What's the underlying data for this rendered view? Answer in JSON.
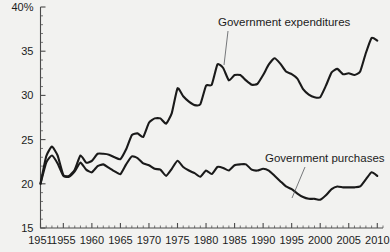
{
  "chart_data": {
    "type": "line",
    "title": "",
    "subtitle": "",
    "xlabel": "",
    "ylabel": "",
    "ylim": [
      15,
      40
    ],
    "xlim": [
      1951,
      2011
    ],
    "grid": false,
    "legend_position": "inline-annotations",
    "y_ticks": [
      "15",
      "20",
      "25",
      "30",
      "35",
      "40%"
    ],
    "y_tick_values": [
      15,
      20,
      25,
      30,
      35,
      40
    ],
    "y_minor_step": 1,
    "x_ticks": [
      "1951",
      "1955",
      "1960",
      "1965",
      "1970",
      "1975",
      "1980",
      "1985",
      "1990",
      "1995",
      "2000",
      "2005",
      "2010"
    ],
    "x_tick_values": [
      1951,
      1955,
      1960,
      1965,
      1970,
      1975,
      1980,
      1985,
      1990,
      1995,
      2000,
      2005,
      2010
    ],
    "x_minor_step": 1,
    "annotations": [
      {
        "name": "expenditures-annotation",
        "text": "Government expenditures",
        "text_x": 218,
        "text_y": 26,
        "leader": [
          [
            228,
            31
          ],
          [
            224,
            65
          ]
        ]
      },
      {
        "name": "purchases-annotation",
        "text": "Government purchases",
        "text_x": 265,
        "text_y": 162,
        "leader": [
          [
            305,
            167
          ],
          [
            292,
            198
          ]
        ]
      }
    ],
    "series": [
      {
        "name": "Government expenditures",
        "color": "#1a1a1a",
        "x": [
          1951,
          1952,
          1953,
          1954,
          1955,
          1956,
          1957,
          1958,
          1959,
          1960,
          1961,
          1962,
          1963,
          1964,
          1965,
          1966,
          1967,
          1968,
          1969,
          1970,
          1971,
          1972,
          1973,
          1974,
          1975,
          1976,
          1977,
          1978,
          1979,
          1980,
          1981,
          1982,
          1983,
          1984,
          1985,
          1986,
          1987,
          1988,
          1989,
          1990,
          1991,
          1992,
          1993,
          1994,
          1995,
          1996,
          1997,
          1998,
          1999,
          2000,
          2001,
          2002,
          2003,
          2004,
          2005,
          2006,
          2007,
          2008,
          2009,
          2010
        ],
        "values": [
          20.0,
          23.1,
          24.2,
          23.2,
          21.0,
          20.9,
          21.6,
          23.2,
          22.4,
          22.6,
          23.4,
          23.4,
          23.3,
          23.0,
          22.8,
          23.9,
          25.5,
          25.7,
          25.3,
          26.9,
          27.4,
          27.4,
          26.8,
          28.0,
          30.8,
          29.9,
          29.3,
          28.9,
          29.0,
          31.1,
          31.2,
          33.5,
          33.1,
          31.7,
          32.3,
          32.3,
          31.7,
          31.2,
          31.3,
          32.3,
          33.5,
          34.2,
          33.6,
          32.7,
          32.4,
          31.9,
          30.7,
          30.1,
          29.8,
          29.8,
          31.1,
          32.6,
          33.0,
          32.4,
          32.5,
          32.3,
          32.7,
          34.8,
          36.5,
          36.2
        ]
      },
      {
        "name": "Government purchases",
        "color": "#1a1a1a",
        "x": [
          1951,
          1952,
          1953,
          1954,
          1955,
          1956,
          1957,
          1958,
          1959,
          1960,
          1961,
          1962,
          1963,
          1964,
          1965,
          1966,
          1967,
          1968,
          1969,
          1970,
          1971,
          1972,
          1973,
          1974,
          1975,
          1976,
          1977,
          1978,
          1979,
          1980,
          1981,
          1982,
          1983,
          1984,
          1985,
          1986,
          1987,
          1988,
          1989,
          1990,
          1991,
          1992,
          1993,
          1994,
          1995,
          1996,
          1997,
          1998,
          1999,
          2000,
          2001,
          2002,
          2003,
          2004,
          2005,
          2006,
          2007,
          2008,
          2009,
          2010
        ],
        "values": [
          20.0,
          22.4,
          23.2,
          22.3,
          20.9,
          20.8,
          21.4,
          22.4,
          21.6,
          21.3,
          22.0,
          22.2,
          21.8,
          21.4,
          21.1,
          22.2,
          23.1,
          22.9,
          22.3,
          22.1,
          21.7,
          21.6,
          20.9,
          21.7,
          22.6,
          21.9,
          21.5,
          21.2,
          20.8,
          21.5,
          21.1,
          21.9,
          21.8,
          21.5,
          22.1,
          22.2,
          22.2,
          21.6,
          21.5,
          21.7,
          21.5,
          20.9,
          20.3,
          19.7,
          19.4,
          18.9,
          18.5,
          18.3,
          18.3,
          18.2,
          18.7,
          19.4,
          19.7,
          19.6,
          19.6,
          19.6,
          19.7,
          20.5,
          21.3,
          20.9
        ]
      }
    ]
  },
  "axis": {
    "y_unit_suffix": "%"
  }
}
